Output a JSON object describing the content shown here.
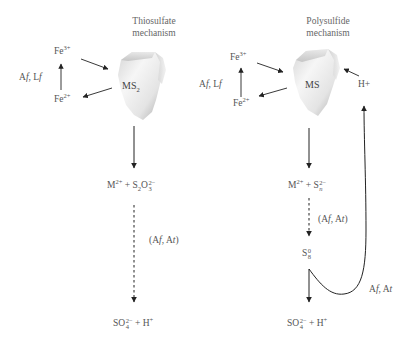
{
  "left_panel": {
    "title_line1": "Thiosulfate",
    "title_line2": "mechanism",
    "mineral": {
      "base": "MS",
      "sub": "2"
    },
    "fe3": {
      "base": "Fe",
      "sup": "3+"
    },
    "fe2": {
      "base": "Fe",
      "sup": "2+"
    },
    "oxidizer_label": {
      "a": "A",
      "a_it": "f",
      "sep": ", L",
      "l_it": "f"
    },
    "product1": {
      "m": "M",
      "m_sup": "2+",
      "plus": " + ",
      "s": "S",
      "s_sub": "2",
      "o": "O",
      "o_sub": "3",
      "o_sup": "2−"
    },
    "step_label": {
      "open": "(A",
      "a_it": "f",
      "mid": ", A",
      "t_it": "t",
      "close": ")"
    },
    "final_product": {
      "so": "SO",
      "so_sub": "4",
      "so_sup": "2−",
      "plus": " + H",
      "h_sup": "+"
    }
  },
  "right_panel": {
    "title_line1": "Polysulfide",
    "title_line2": "mechanism",
    "mineral": {
      "base": "MS"
    },
    "fe3": {
      "base": "Fe",
      "sup": "3+"
    },
    "fe2": {
      "base": "Fe",
      "sup": "2+"
    },
    "oxidizer_label": {
      "a": "A",
      "a_it": "f",
      "sep": ", L",
      "l_it": "f"
    },
    "proton": "H+",
    "product1": {
      "m": "M",
      "m_sup": "2+",
      "plus": " + ",
      "s": "S",
      "s_sub": "n",
      "s_sup": "2−"
    },
    "step_label": {
      "open": "(A",
      "a_it": "f",
      "mid": ", A",
      "t_it": "t",
      "close": ")"
    },
    "sulfur": {
      "s": "S",
      "sub": "8",
      "sup": "0"
    },
    "loop_label": {
      "a": "A",
      "a_it": "f",
      "mid": ", A",
      "t_it": "t"
    },
    "final_product": {
      "so": "SO",
      "so_sub": "4",
      "so_sup": "2−",
      "plus": " + H",
      "h_sup": "+"
    }
  },
  "colors": {
    "arrow": "#222222",
    "text": "#555555",
    "mineral_light": "#f2f2f2",
    "mineral_dark": "#b8b8b8"
  }
}
